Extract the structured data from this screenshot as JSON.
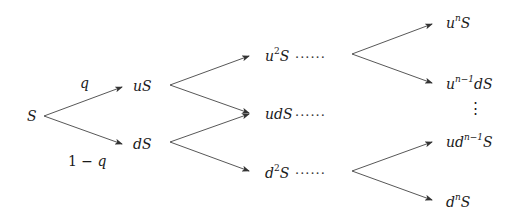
{
  "diagram": {
    "root": {
      "label": "S"
    },
    "probabilities": {
      "up": "q",
      "down": "1 − q"
    },
    "step1": [
      {
        "id": "uS",
        "base": "uS"
      },
      {
        "id": "dS",
        "base": "dS"
      }
    ],
    "step2": [
      {
        "id": "u2S",
        "pre": "u",
        "sup": "2",
        "post": "S",
        "ellipsis": "······"
      },
      {
        "id": "udS",
        "base": "udS",
        "ellipsis": "······"
      },
      {
        "id": "d2S",
        "pre": "d",
        "sup": "2",
        "post": "S",
        "ellipsis": "······"
      }
    ],
    "final": [
      {
        "id": "unS",
        "pre": "u",
        "sup": "n",
        "post": "S"
      },
      {
        "id": "un-1dS",
        "pre": "u",
        "sup": "n−1",
        "post": "dS"
      },
      {
        "id": "udn-1S",
        "pre": "ud",
        "sup": "n−1",
        "post": "S"
      },
      {
        "id": "dnS",
        "pre": "d",
        "sup": "n",
        "post": "S"
      }
    ],
    "vertical_ellipsis": "⋮",
    "line_color": "#333333"
  }
}
